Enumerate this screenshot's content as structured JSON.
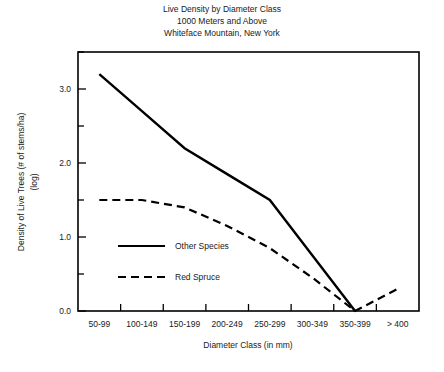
{
  "figure": {
    "title_lines": [
      "Live Density by Diameter Class",
      "1000 Meters and Above",
      "Whiteface Mountain, New York"
    ]
  },
  "chart_data": {
    "type": "line",
    "title": "Live Density by Diameter Class\n1000 Meters and Above\nWhiteface Mountain, New York",
    "xlabel": "Diameter Class (in mm)",
    "ylabel": "Density of Live Trees (# of stems/ha) (log)",
    "ylabel_lines": [
      "Density of Live Trees (# of stems/ha)",
      "(log)"
    ],
    "categories": [
      "50-99",
      "100-149",
      "150-199",
      "200-249",
      "250-299",
      "300-349",
      "350-399",
      "> 400"
    ],
    "series": [
      {
        "name": "Other Species",
        "style": "solid",
        "values": [
          3.2,
          2.7,
          2.2,
          1.85,
          1.5,
          0.75,
          0.0,
          null
        ]
      },
      {
        "name": "Red Spruce",
        "style": "dashed",
        "values": [
          1.5,
          1.5,
          1.4,
          1.15,
          0.85,
          0.45,
          0.0,
          0.3
        ]
      }
    ],
    "ylim": [
      0.0,
      3.5
    ],
    "xlim": [
      0,
      8
    ],
    "y_major_ticks": [
      0.0,
      1.0,
      2.0,
      3.0
    ],
    "y_major_tick_labels": [
      "0.0",
      "1.0",
      "2.0",
      "3.0"
    ],
    "y_minor_ticks": [
      0.5,
      1.5,
      2.5,
      3.5
    ],
    "grid": false,
    "legend_position": "inside-lower-left",
    "legend_entries": [
      "Other Species",
      "Red Spruce"
    ]
  },
  "colors": {
    "line": "#000000",
    "text": "#1a1a1a",
    "background": "#ffffff"
  }
}
